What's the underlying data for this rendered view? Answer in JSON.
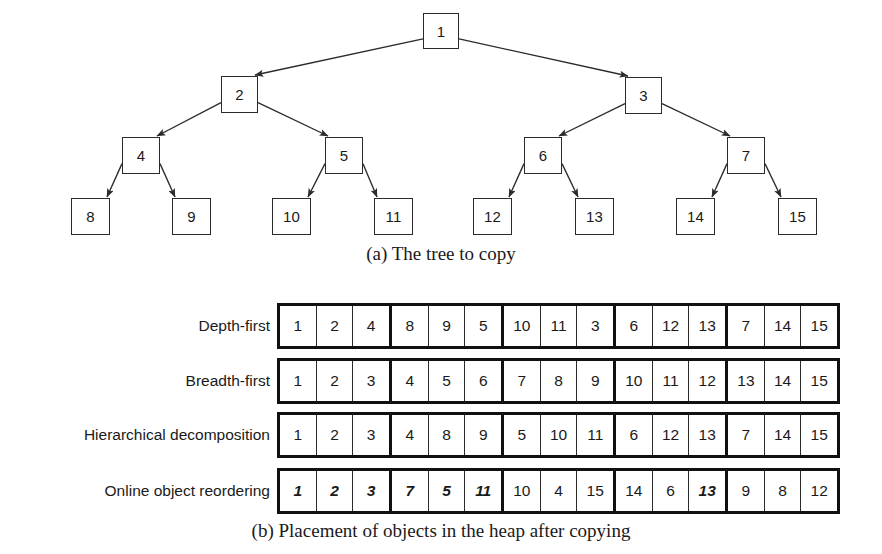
{
  "figure": {
    "caption_a": "(a) The tree to copy",
    "caption_b": "(b) Placement of objects in the heap after copying"
  },
  "chart_data": {
    "type": "diagram",
    "title": "Placement of objects in the heap after copying",
    "tree": {
      "label": "(a) The tree to copy",
      "description": "Complete binary tree with 15 nodes, numbered 1-15 in breadth-first order",
      "nodes": [
        {
          "id": 1,
          "label": "1",
          "level": 0,
          "x": 423,
          "y": 13,
          "w": 36,
          "h": 36
        },
        {
          "id": 2,
          "label": "2",
          "level": 1,
          "x": 221,
          "y": 76,
          "w": 37,
          "h": 37
        },
        {
          "id": 3,
          "label": "3",
          "level": 1,
          "x": 625,
          "y": 77,
          "w": 37,
          "h": 37
        },
        {
          "id": 4,
          "label": "4",
          "level": 2,
          "x": 122,
          "y": 137,
          "w": 38,
          "h": 37
        },
        {
          "id": 5,
          "label": "5",
          "level": 2,
          "x": 325,
          "y": 137,
          "w": 38,
          "h": 37
        },
        {
          "id": 6,
          "label": "6",
          "level": 2,
          "x": 524,
          "y": 137,
          "w": 38,
          "h": 37
        },
        {
          "id": 7,
          "label": "7",
          "level": 2,
          "x": 727,
          "y": 137,
          "w": 38,
          "h": 37
        },
        {
          "id": 8,
          "label": "8",
          "level": 3,
          "x": 71,
          "y": 198,
          "w": 39,
          "h": 37
        },
        {
          "id": 9,
          "label": "9",
          "level": 3,
          "x": 172,
          "y": 198,
          "w": 39,
          "h": 37
        },
        {
          "id": 10,
          "label": "10",
          "level": 3,
          "x": 272,
          "y": 198,
          "w": 39,
          "h": 37
        },
        {
          "id": 11,
          "label": "11",
          "level": 3,
          "x": 374,
          "y": 198,
          "w": 39,
          "h": 37
        },
        {
          "id": 12,
          "label": "12",
          "level": 3,
          "x": 473,
          "y": 198,
          "w": 39,
          "h": 37
        },
        {
          "id": 13,
          "label": "13",
          "level": 3,
          "x": 575,
          "y": 198,
          "w": 39,
          "h": 37
        },
        {
          "id": 14,
          "label": "14",
          "level": 3,
          "x": 676,
          "y": 198,
          "w": 39,
          "h": 37
        },
        {
          "id": 15,
          "label": "15",
          "level": 3,
          "x": 778,
          "y": 198,
          "w": 39,
          "h": 37
        }
      ],
      "edges": [
        {
          "from": 1,
          "to": 2
        },
        {
          "from": 1,
          "to": 3
        },
        {
          "from": 2,
          "to": 4
        },
        {
          "from": 2,
          "to": 5
        },
        {
          "from": 3,
          "to": 6
        },
        {
          "from": 3,
          "to": 7
        },
        {
          "from": 4,
          "to": 8
        },
        {
          "from": 4,
          "to": 9
        },
        {
          "from": 5,
          "to": 10
        },
        {
          "from": 5,
          "to": 11
        },
        {
          "from": 6,
          "to": 12
        },
        {
          "from": 6,
          "to": 13
        },
        {
          "from": 7,
          "to": 14
        },
        {
          "from": 7,
          "to": 15
        }
      ]
    },
    "heap_rows": [
      {
        "label": "Depth-first",
        "values": [
          "1",
          "2",
          "4",
          "8",
          "9",
          "5",
          "10",
          "11",
          "3",
          "6",
          "12",
          "13",
          "7",
          "14",
          "15"
        ],
        "emphasized": [
          false,
          false,
          false,
          false,
          false,
          false,
          false,
          false,
          false,
          false,
          false,
          false,
          false,
          false,
          false
        ],
        "group_size": 3
      },
      {
        "label": "Breadth-first",
        "values": [
          "1",
          "2",
          "3",
          "4",
          "5",
          "6",
          "7",
          "8",
          "9",
          "10",
          "11",
          "12",
          "13",
          "14",
          "15"
        ],
        "emphasized": [
          false,
          false,
          false,
          false,
          false,
          false,
          false,
          false,
          false,
          false,
          false,
          false,
          false,
          false,
          false
        ],
        "group_size": 3
      },
      {
        "label": "Hierarchical decomposition",
        "values": [
          "1",
          "2",
          "3",
          "4",
          "8",
          "9",
          "5",
          "10",
          "11",
          "6",
          "12",
          "13",
          "7",
          "14",
          "15"
        ],
        "emphasized": [
          false,
          false,
          false,
          false,
          false,
          false,
          false,
          false,
          false,
          false,
          false,
          false,
          false,
          false,
          false
        ],
        "group_size": 3
      },
      {
        "label": "Online object reordering",
        "values": [
          "1",
          "2",
          "3",
          "7",
          "5",
          "11",
          "10",
          "4",
          "15",
          "14",
          "6",
          "13",
          "9",
          "8",
          "12"
        ],
        "emphasized": [
          true,
          true,
          true,
          true,
          true,
          true,
          false,
          false,
          false,
          false,
          false,
          true,
          false,
          false,
          false
        ],
        "group_size": 3
      }
    ],
    "colors": {
      "ink": "#1a1a1a",
      "border": "#2b2b2b",
      "thick_border": "#111111",
      "background": "#ffffff"
    }
  }
}
